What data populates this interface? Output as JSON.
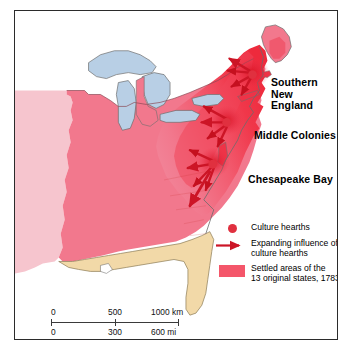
{
  "map": {
    "title": "Culture hearths of the eastern United States, 1783",
    "labels": [
      {
        "id": "southern-new-england",
        "text": "Southern\nNew England"
      },
      {
        "id": "middle-colonies",
        "text": "Middle Colonies"
      },
      {
        "id": "chesapeake-bay",
        "text": "Chesapeake Bay"
      }
    ],
    "colors": {
      "settled_13_states": "#ee3347",
      "hearth_core": "#e8202f",
      "settled_mid": "#f4566a",
      "land_medium_pink": "#f2788d",
      "land_light_pink": "#f6c5ce",
      "spanish_territory_tan": "#f2d9a8",
      "great_lakes_blue": "#b8cfe5",
      "coastline": "#5a5a5a",
      "frame": "#2b2b2b",
      "arrow_red": "#cc1526",
      "hearth_dot": "#e0303f",
      "ocean_white": "#ffffff"
    }
  },
  "legend": {
    "items": [
      {
        "symbol": "dot",
        "label": "Culture hearths"
      },
      {
        "symbol": "arrow",
        "label": "Expanding influence of\nculture hearths"
      },
      {
        "symbol": "swatch",
        "label": "Settled areas of the\n13 original states, 1783"
      }
    ]
  },
  "scale_bar": {
    "km": {
      "start": "0",
      "mid": "500",
      "end": "1000 km"
    },
    "mi": {
      "start": "0",
      "mid": "300",
      "end": "600 mi"
    }
  }
}
